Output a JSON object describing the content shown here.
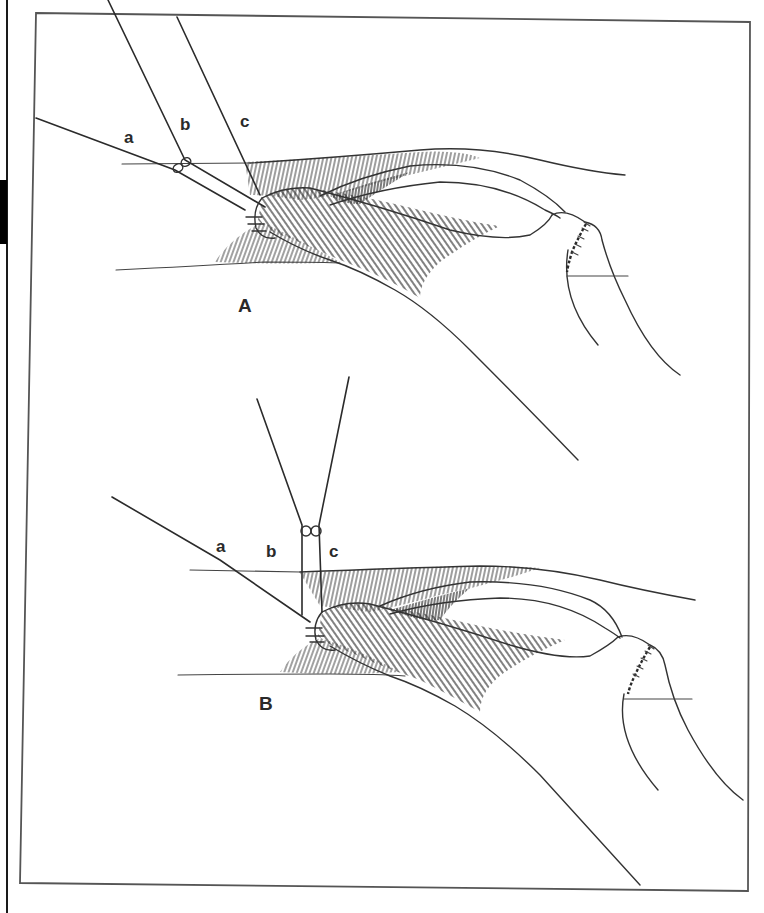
{
  "figure": {
    "panels": [
      {
        "id": "A",
        "label": "A",
        "thread_labels": {
          "a": "a",
          "b": "b",
          "c": "c"
        }
      },
      {
        "id": "B",
        "label": "B",
        "thread_labels": {
          "a": "a",
          "b": "b",
          "c": "c"
        }
      }
    ],
    "colors": {
      "ink": "#2a2a2a",
      "background": "#ffffff",
      "frame": "#555555"
    }
  }
}
